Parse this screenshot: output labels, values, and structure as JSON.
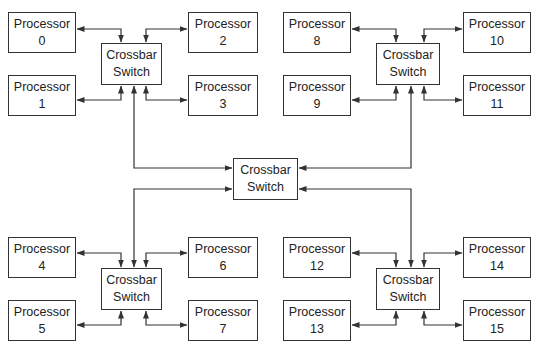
{
  "diagram": {
    "type": "hierarchical crossbar interconnect",
    "colors": {
      "line": "#333333",
      "box_border": "#333333",
      "background": "#ffffff",
      "text": "#222222"
    },
    "central_switch": {
      "line1": "Crossbar",
      "line2": "Switch"
    },
    "clusters": [
      {
        "name": "top-left",
        "switch": {
          "line1": "Crossbar",
          "line2": "Switch"
        },
        "processors": [
          {
            "label": "Processor",
            "id": "0"
          },
          {
            "label": "Processor",
            "id": "1"
          },
          {
            "label": "Processor",
            "id": "2"
          },
          {
            "label": "Processor",
            "id": "3"
          }
        ]
      },
      {
        "name": "top-right",
        "switch": {
          "line1": "Crossbar",
          "line2": "Switch"
        },
        "processors": [
          {
            "label": "Processor",
            "id": "8"
          },
          {
            "label": "Processor",
            "id": "9"
          },
          {
            "label": "Processor",
            "id": "10"
          },
          {
            "label": "Processor",
            "id": "11"
          }
        ]
      },
      {
        "name": "bottom-left",
        "switch": {
          "line1": "Crossbar",
          "line2": "Switch"
        },
        "processors": [
          {
            "label": "Processor",
            "id": "4"
          },
          {
            "label": "Processor",
            "id": "5"
          },
          {
            "label": "Processor",
            "id": "6"
          },
          {
            "label": "Processor",
            "id": "7"
          }
        ]
      },
      {
        "name": "bottom-right",
        "switch": {
          "line1": "Crossbar",
          "line2": "Switch"
        },
        "processors": [
          {
            "label": "Processor",
            "id": "12"
          },
          {
            "label": "Processor",
            "id": "13"
          },
          {
            "label": "Processor",
            "id": "14"
          },
          {
            "label": "Processor",
            "id": "15"
          }
        ]
      }
    ]
  }
}
